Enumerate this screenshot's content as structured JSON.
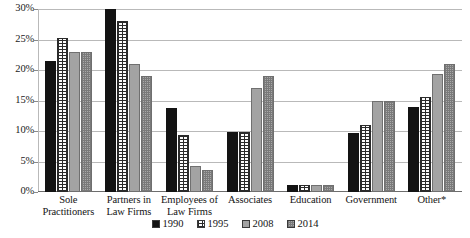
{
  "chart_data": {
    "type": "bar",
    "title": "",
    "subtitle": "",
    "xlabel": "",
    "ylabel": "",
    "ylim": [
      0,
      30
    ],
    "ytick_values": [
      0,
      5,
      10,
      15,
      20,
      25,
      30
    ],
    "ytick_labels": [
      "0%",
      "5%",
      "10%",
      "15%",
      "20%",
      "25%",
      "30%"
    ],
    "grid": true,
    "legend_position": "bottom-center",
    "categories": [
      "Sole Practitioners",
      "Partners in Law Firms",
      "Employees of Law Firms",
      "Associates",
      "Education",
      "Government",
      "Other*"
    ],
    "series": [
      {
        "name": "1990",
        "pattern": "solid-black",
        "color": "#131313",
        "values": [
          21.5,
          30.0,
          13.7,
          9.8,
          1.1,
          9.7,
          13.9
        ]
      },
      {
        "name": "1995",
        "pattern": "grid-on-white",
        "color": "#fdfdfd",
        "values": [
          25.3,
          28.0,
          9.3,
          9.9,
          1.1,
          11.0,
          15.6
        ]
      },
      {
        "name": "2008",
        "pattern": "solid-gray",
        "color": "#a3a3a3",
        "values": [
          23.0,
          21.0,
          4.3,
          17.0,
          1.1,
          15.0,
          19.3
        ]
      },
      {
        "name": "2014",
        "pattern": "dotted-gray",
        "color": "#a8a8a8",
        "values": [
          23.0,
          19.0,
          3.6,
          19.0,
          1.1,
          15.0,
          21.0
        ]
      }
    ]
  }
}
